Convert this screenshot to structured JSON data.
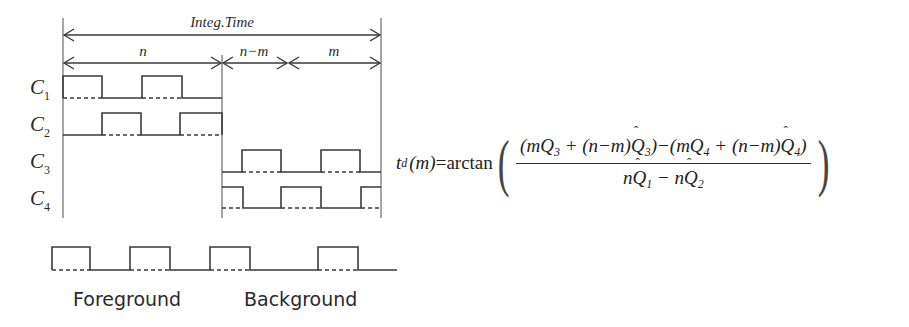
{
  "timing_diagram": {
    "span_labels": {
      "integration": "Integ.Time",
      "first": "n",
      "middle": "n−m",
      "last": "m"
    },
    "channels": [
      {
        "label": "C",
        "sub": "1"
      },
      {
        "label": "C",
        "sub": "2"
      },
      {
        "label": "C",
        "sub": "3"
      },
      {
        "label": "C",
        "sub": "4"
      }
    ],
    "reference_signal": {
      "captions": {
        "foreground": "Foreground",
        "background": "Background"
      }
    }
  },
  "formula": {
    "lhs_var": "t",
    "lhs_sub": "d",
    "lhs_arg": "(m)",
    "equals": "=",
    "func": "arctan",
    "numerator": "(mQ3 + (n−m)Q̂3) − (mQ4 + (n−m)Q̂4)",
    "denominator": "nQ̂1 − nQ̂2",
    "parts": {
      "num_a": "(mQ",
      "num_a_sub": "3",
      "num_b": " + (n−m)",
      "num_b_q": "Q",
      "num_b_sub": "3",
      "num_c": ")−(mQ",
      "num_c_sub": "4",
      "num_d": " + (n−m)",
      "num_d_q": "Q",
      "num_d_sub": "4",
      "num_e": ")",
      "den_a": "n",
      "den_a_q": "Q",
      "den_a_sub": "1",
      "den_b": " − n",
      "den_b_q": "Q",
      "den_b_sub": "2",
      "lparen": "(",
      "rparen": ")"
    }
  }
}
